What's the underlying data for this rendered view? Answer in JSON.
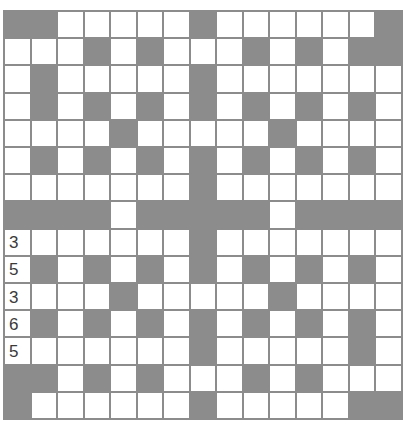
{
  "puzzle": {
    "type": "crossword-grid",
    "size": {
      "rows": 15,
      "cols": 15
    },
    "colors": {
      "block": "#8c8c8c",
      "open": "#ffffff",
      "grid_line": "#8c8c8c",
      "number_text": "#3a3a3a"
    },
    "legend": {
      "B": "block",
      "W": "open"
    },
    "rows": [
      "BBWWWWWBWWWWWWB",
      "WWWBWBWWWBWBWBB",
      "WBWWWWWBWWWWWWW",
      "WBWBWBWBWBWBWBW",
      "WWWWBWWWWWBWWWW",
      "WBWBWBWBWBWBWBW",
      "WWWWWWWBWWWWWWW",
      "BBBBWBBBBBWBBBB",
      "WWWWWWWBWWWWWWW",
      "WBWBWBWBWBWBWBW",
      "WWWWBWWWWWBWWWW",
      "WBWBWBWBWBWBWBW",
      "WWWWWWWBWWWWWBW",
      "BBWBWBWWWBWBWWW",
      "BWWWWWWBWWWWWBB"
    ],
    "cell_labels": [
      {
        "row": 8,
        "col": 0,
        "text": "3"
      },
      {
        "row": 9,
        "col": 0,
        "text": "5"
      },
      {
        "row": 10,
        "col": 0,
        "text": "3"
      },
      {
        "row": 11,
        "col": 0,
        "text": "6"
      },
      {
        "row": 12,
        "col": 0,
        "text": "5"
      }
    ]
  }
}
